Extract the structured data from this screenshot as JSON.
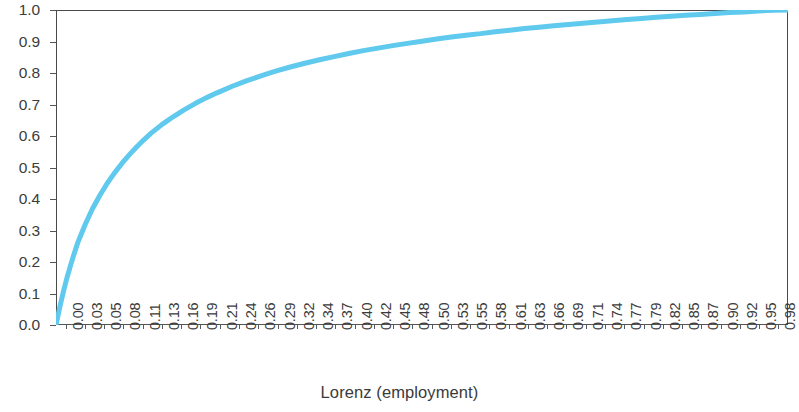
{
  "chart_data": {
    "type": "line",
    "title": "",
    "subtitle": "",
    "xlabel": "Lorenz (employment)",
    "ylabel": "",
    "xlim": [
      0.0,
      1.0
    ],
    "ylim": [
      0.0,
      1.0
    ],
    "grid": false,
    "legend": null,
    "legend_position": "none",
    "line_color": "#5FC9EE",
    "axis_color": "#4a4a4a",
    "background_color": "#ffffff",
    "y_ticks": [
      "0.0",
      "0.1",
      "0.2",
      "0.3",
      "0.4",
      "0.5",
      "0.6",
      "0.7",
      "0.8",
      "0.9",
      "1.0"
    ],
    "x_ticks": [
      "0.00",
      "0.03",
      "0.05",
      "0.08",
      "0.11",
      "0.13",
      "0.16",
      "0.19",
      "0.21",
      "0.24",
      "0.26",
      "0.29",
      "0.32",
      "0.34",
      "0.37",
      "0.40",
      "0.42",
      "0.45",
      "0.48",
      "0.50",
      "0.53",
      "0.55",
      "0.58",
      "0.61",
      "0.63",
      "0.66",
      "0.69",
      "0.71",
      "0.74",
      "0.77",
      "0.79",
      "0.82",
      "0.85",
      "0.87",
      "0.90",
      "0.92",
      "0.95",
      "0.98"
    ],
    "series": [
      {
        "name": "Lorenz (employment)",
        "x": [
          0.0,
          0.005,
          0.01,
          0.015,
          0.02,
          0.025,
          0.03,
          0.04,
          0.05,
          0.06,
          0.07,
          0.08,
          0.09,
          0.1,
          0.11,
          0.12,
          0.13,
          0.145,
          0.16,
          0.175,
          0.19,
          0.205,
          0.22,
          0.24,
          0.26,
          0.28,
          0.3,
          0.32,
          0.34,
          0.36,
          0.38,
          0.4,
          0.42,
          0.44,
          0.46,
          0.48,
          0.5,
          0.52,
          0.54,
          0.56,
          0.58,
          0.6,
          0.62,
          0.64,
          0.66,
          0.68,
          0.7,
          0.72,
          0.74,
          0.76,
          0.78,
          0.8,
          0.82,
          0.84,
          0.86,
          0.88,
          0.9,
          0.92,
          0.94,
          0.96,
          0.98,
          1.0
        ],
        "y": [
          0.0,
          0.055,
          0.105,
          0.15,
          0.19,
          0.228,
          0.263,
          0.32,
          0.37,
          0.412,
          0.45,
          0.483,
          0.513,
          0.54,
          0.565,
          0.588,
          0.609,
          0.637,
          0.661,
          0.683,
          0.703,
          0.721,
          0.737,
          0.757,
          0.775,
          0.791,
          0.806,
          0.819,
          0.831,
          0.842,
          0.852,
          0.862,
          0.871,
          0.879,
          0.887,
          0.894,
          0.901,
          0.908,
          0.914,
          0.92,
          0.925,
          0.931,
          0.936,
          0.941,
          0.945,
          0.95,
          0.954,
          0.958,
          0.962,
          0.966,
          0.97,
          0.973,
          0.977,
          0.98,
          0.983,
          0.986,
          0.989,
          0.992,
          0.994,
          0.997,
          0.999,
          1.0
        ]
      }
    ]
  }
}
